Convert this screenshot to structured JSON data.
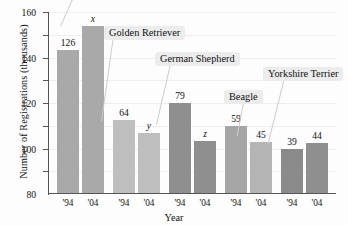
{
  "chart_data": {
    "type": "bar",
    "title": "",
    "xlabel": "Year",
    "ylabel": "Number of Registrations (thousands)",
    "ylim": [
      0,
      160
    ],
    "ytick_values": [
      20,
      40,
      60,
      80,
      100,
      120,
      140,
      160
    ],
    "ytick_labels": [
      "20",
      "40",
      "60",
      "80",
      "100",
      "120",
      "140",
      "160"
    ],
    "grid": true,
    "legend": "none",
    "categories": [
      "'94",
      "'04",
      "'94",
      "'04",
      "'94",
      "'04",
      "'94",
      "'04",
      "'94",
      "'04"
    ],
    "groups": [
      "Labrador Retriever",
      "Golden Retriever",
      "German Shepherd",
      "Beagle",
      "Yorkshire Terrier"
    ],
    "annotations": [
      {
        "text": "Golden Retriever",
        "points_to_group": 1
      },
      {
        "text": "German Shepherd",
        "points_to_group": 2
      },
      {
        "text": "Beagle",
        "points_to_group": 3
      },
      {
        "text": "Yorkshire Terrier",
        "points_to_group": 4
      }
    ],
    "bars": [
      {
        "group": "Labrador Retriever",
        "year": "'94",
        "value": 126,
        "label": "126",
        "italic": false,
        "color": "#a9a9a9"
      },
      {
        "group": "Labrador Retriever",
        "year": "'04",
        "value": 147,
        "label": "x",
        "italic": true,
        "color": "#a9a9a9"
      },
      {
        "group": "Golden Retriever",
        "year": "'94",
        "value": 64,
        "label": "64",
        "italic": false,
        "color": "#bebebe"
      },
      {
        "group": "Golden Retriever",
        "year": "'04",
        "value": 53,
        "label": "y",
        "italic": true,
        "color": "#bebebe"
      },
      {
        "group": "German Shepherd",
        "year": "'94",
        "value": 79,
        "label": "79",
        "italic": false,
        "color": "#8f8f8f"
      },
      {
        "group": "German Shepherd",
        "year": "'04",
        "value": 46,
        "label": "z",
        "italic": true,
        "color": "#8f8f8f"
      },
      {
        "group": "Beagle",
        "year": "'94",
        "value": 59,
        "label": "59",
        "italic": false,
        "color": "#a5a5a5"
      },
      {
        "group": "Beagle",
        "year": "'04",
        "value": 45,
        "label": "45",
        "italic": false,
        "color": "#b4b4b4"
      },
      {
        "group": "Yorkshire Terrier",
        "year": "'94",
        "value": 39,
        "label": "39",
        "italic": false,
        "color": "#8b8b8b"
      },
      {
        "group": "Yorkshire Terrier",
        "year": "'04",
        "value": 44,
        "label": "44",
        "italic": false,
        "color": "#8f8f8f"
      }
    ]
  },
  "axes": {
    "y_title": "Number of Registrations (thousands)",
    "x_title": "Year",
    "y_ticks": [
      "160",
      "140",
      "120",
      "100",
      "80",
      "60",
      "40",
      "20"
    ]
  },
  "callouts": {
    "golden_retriever": "Golden Retriever",
    "german_shepherd": "German Shepherd",
    "beagle": "Beagle",
    "yorkshire_terrier": "Yorkshire Terrier"
  },
  "bar_labels": {
    "b0": "126",
    "b1": "x",
    "b2": "64",
    "b3": "y",
    "b4": "79",
    "b5": "z",
    "b6": "59",
    "b7": "45",
    "b8": "39",
    "b9": "44"
  },
  "xtick_labels": {
    "t0": "'94",
    "t1": "'04",
    "t2": "'94",
    "t3": "'04",
    "t4": "'94",
    "t5": "'04",
    "t6": "'94",
    "t7": "'04",
    "t8": "'94",
    "t9": "'04"
  },
  "colors": {
    "bar_light": "#bebebe",
    "bar_mid": "#a9a9a9",
    "bar_dark": "#8b8b8b",
    "callout_bg": "#ececec",
    "axis": "#555555",
    "grid": "#eeeeee"
  }
}
